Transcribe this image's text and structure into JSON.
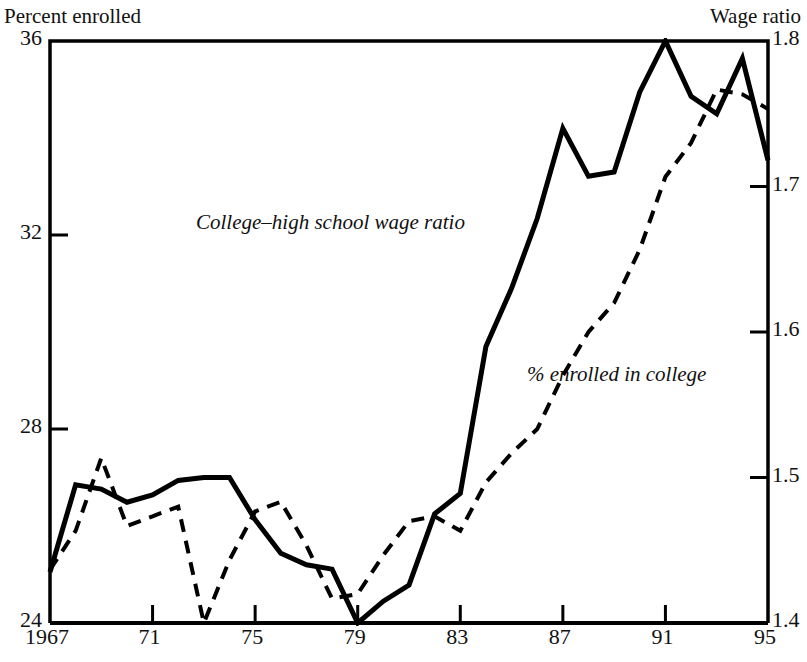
{
  "axes": {
    "left_title": "Percent enrolled",
    "right_title": "Wage ratio"
  },
  "annotations": {
    "wage_label": "College–high school wage ratio",
    "enroll_label": "% enrolled in college"
  },
  "chart_data": {
    "type": "line",
    "title": "",
    "xlabel": "",
    "ylabel": "Percent enrolled",
    "y2label": "Wage ratio",
    "xlim": [
      1967,
      1995
    ],
    "ylim": [
      24,
      36
    ],
    "y2lim": [
      1.4,
      1.8
    ],
    "grid": false,
    "legend": "inline-annotations",
    "x_ticks": [
      "1967",
      "71",
      "75",
      "79",
      "83",
      "87",
      "91",
      "95"
    ],
    "x_tick_values": [
      1967,
      1971,
      1975,
      1979,
      1983,
      1987,
      1991,
      1995
    ],
    "y_ticks_left": [
      "24",
      "28",
      "32",
      "36"
    ],
    "y_tick_values_left": [
      24,
      28,
      32,
      36
    ],
    "y_ticks_right": [
      "1.4",
      "1.5",
      "1.6",
      "1.7",
      "1.8"
    ],
    "y_tick_values_right": [
      1.4,
      1.5,
      1.6,
      1.7,
      1.8
    ],
    "x": [
      1967,
      1968,
      1969,
      1970,
      1971,
      1972,
      1973,
      1974,
      1975,
      1976,
      1977,
      1978,
      1979,
      1980,
      1981,
      1982,
      1983,
      1984,
      1985,
      1986,
      1987,
      1988,
      1989,
      1990,
      1991,
      1992,
      1993,
      1994,
      1995
    ],
    "series": [
      {
        "name": "College–high school wage ratio",
        "style": "solid",
        "axis": "right",
        "color": "#000000",
        "values": [
          1.435,
          1.495,
          1.492,
          1.483,
          1.488,
          1.498,
          1.5,
          1.5,
          1.471,
          1.448,
          1.44,
          1.437,
          1.4,
          1.415,
          1.426,
          1.475,
          1.489,
          1.59,
          1.63,
          1.678,
          1.74,
          1.707,
          1.71,
          1.765,
          1.8,
          1.762,
          1.75,
          1.788,
          1.718
        ]
      },
      {
        "name": "% enrolled in college",
        "style": "dashed",
        "axis": "left",
        "color": "#000000",
        "values": [
          25.1,
          25.9,
          27.4,
          26.0,
          26.2,
          26.4,
          24.0,
          25.3,
          26.3,
          26.5,
          25.6,
          24.5,
          24.6,
          25.4,
          26.1,
          26.2,
          25.9,
          26.9,
          27.5,
          28.0,
          29.1,
          30.0,
          30.6,
          31.7,
          33.2,
          33.9,
          35.0,
          34.9,
          34.6
        ]
      }
    ]
  }
}
